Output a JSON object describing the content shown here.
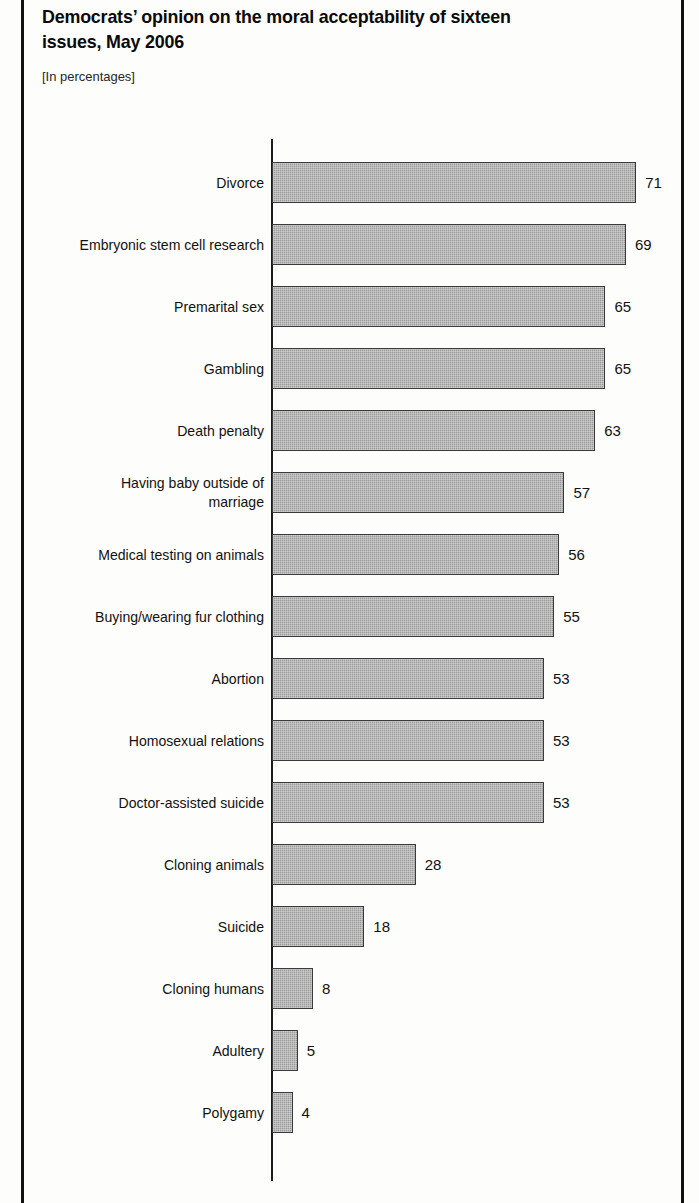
{
  "figure": {
    "title": "Democrats’ opinion on the moral acceptability of sixteen issues, May 2006",
    "title_line1": "Democrats’ opinion on the moral acceptability of sixteen",
    "title_line2": "issues, May 2006",
    "subtitle": "[In percentages]",
    "frame_color": "#111111",
    "bar_fill": "#9c9c9c",
    "bar_border": "#3a3a3a",
    "text_color": "#111111"
  },
  "chart_data": {
    "type": "bar",
    "orientation": "horizontal",
    "title": "Democrats’ opinion on the moral acceptability of sixteen issues, May 2006",
    "subtitle": "[In percentages]",
    "xlabel": "",
    "ylabel": "",
    "unit": "percent",
    "xlim": [
      0,
      71
    ],
    "grid": false,
    "legend": null,
    "value_labels": true,
    "categories": [
      "Divorce",
      "Embryonic stem cell research",
      "Premarital sex",
      "Gambling",
      "Death penalty",
      "Having baby outside of marriage",
      "Medical testing on animals",
      "Buying/wearing fur clothing",
      "Abortion",
      "Homosexual relations",
      "Doctor-assisted suicide",
      "Cloning animals",
      "Suicide",
      "Cloning humans",
      "Adultery",
      "Polygamy"
    ],
    "values": [
      71,
      69,
      65,
      65,
      63,
      57,
      56,
      55,
      53,
      53,
      53,
      28,
      18,
      8,
      5,
      4
    ],
    "bars": [
      {
        "label": "Divorce",
        "label_lines": [
          "Divorce"
        ],
        "value": 71,
        "value_text": "71"
      },
      {
        "label": "Embryonic stem cell research",
        "label_lines": [
          "Embryonic stem cell research"
        ],
        "value": 69,
        "value_text": "69"
      },
      {
        "label": "Premarital sex",
        "label_lines": [
          "Premarital sex"
        ],
        "value": 65,
        "value_text": "65"
      },
      {
        "label": "Gambling",
        "label_lines": [
          "Gambling"
        ],
        "value": 65,
        "value_text": "65"
      },
      {
        "label": "Death penalty",
        "label_lines": [
          "Death penalty"
        ],
        "value": 63,
        "value_text": "63"
      },
      {
        "label": "Having baby outside of marriage",
        "label_lines": [
          "Having baby outside of",
          "marriage"
        ],
        "value": 57,
        "value_text": "57"
      },
      {
        "label": "Medical testing on animals",
        "label_lines": [
          "Medical testing on animals"
        ],
        "value": 56,
        "value_text": "56"
      },
      {
        "label": "Buying/wearing fur clothing",
        "label_lines": [
          "Buying/wearing fur clothing"
        ],
        "value": 55,
        "value_text": "55"
      },
      {
        "label": "Abortion",
        "label_lines": [
          "Abortion"
        ],
        "value": 53,
        "value_text": "53"
      },
      {
        "label": "Homosexual relations",
        "label_lines": [
          "Homosexual relations"
        ],
        "value": 53,
        "value_text": "53"
      },
      {
        "label": "Doctor-assisted suicide",
        "label_lines": [
          "Doctor-assisted suicide"
        ],
        "value": 53,
        "value_text": "53"
      },
      {
        "label": "Cloning animals",
        "label_lines": [
          "Cloning animals"
        ],
        "value": 28,
        "value_text": "28"
      },
      {
        "label": "Suicide",
        "label_lines": [
          "Suicide"
        ],
        "value": 18,
        "value_text": "18"
      },
      {
        "label": "Cloning humans",
        "label_lines": [
          "Cloning humans"
        ],
        "value": 8,
        "value_text": "8"
      },
      {
        "label": "Adultery",
        "label_lines": [
          "Adultery"
        ],
        "value": 5,
        "value_text": "5"
      },
      {
        "label": "Polygamy",
        "label_lines": [
          "Polygamy"
        ],
        "value": 4,
        "value_text": "4"
      }
    ]
  },
  "geometry": {
    "axis_x": 272,
    "first_bar_top": 162,
    "bar_height": 41,
    "row_pitch": 62,
    "px_per_unit": 5.13,
    "label_right": 264
  }
}
